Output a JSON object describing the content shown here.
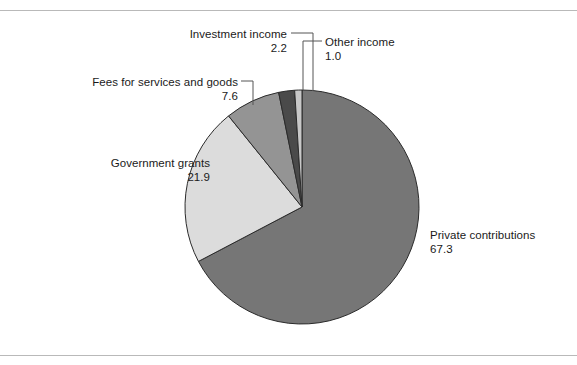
{
  "chart_data": {
    "type": "pie",
    "title": "",
    "subtitle": "",
    "xlabel": "",
    "ylabel": "",
    "legend_position": "none",
    "grid": false,
    "labels_outside": true,
    "start_angle_deg": 0,
    "direction": "clockwise",
    "categories": [
      "Private contributions",
      "Government grants",
      "Fees for services and goods",
      "Investment income",
      "Other income"
    ],
    "values": [
      67.3,
      21.9,
      7.6,
      2.2,
      1.0
    ],
    "value_labels": [
      "67.3",
      "21.9",
      "7.6",
      "2.2",
      "1.0"
    ],
    "colors": [
      "#767676",
      "#dcdcdc",
      "#949494",
      "#4a4a4a",
      "#c8c8c8"
    ],
    "slice_border_color": "#2b2b2b",
    "total": 100.0
  },
  "figure": {
    "background": "#ffffff",
    "rule_color": "#b9b9b9"
  },
  "slices": {
    "private_contributions": {
      "name": "Private contributions",
      "value": "67.3",
      "color": "#767676"
    },
    "government_grants": {
      "name": "Government grants",
      "value": "21.9",
      "color": "#dcdcdc"
    },
    "fees_services_goods": {
      "name": "Fees for services and goods",
      "value": "7.6",
      "color": "#949494"
    },
    "investment_income": {
      "name": "Investment income",
      "value": "2.2",
      "color": "#4a4a4a"
    },
    "other_income": {
      "name": "Other income",
      "value": "1.0",
      "color": "#c8c8c8"
    }
  }
}
